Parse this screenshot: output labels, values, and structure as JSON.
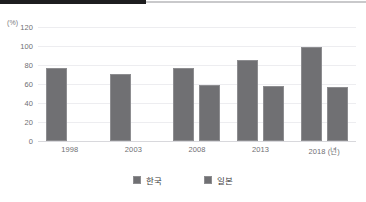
{
  "decor": {
    "top_dark_band": "#1d1d1f",
    "top_light_band": "#c9c9cb"
  },
  "colors": {
    "bar": "#707073",
    "bar_border": "#8d8d90",
    "gridline": "#ededf0",
    "baseline": "#d8d8dc",
    "tick_text": "#6f6f73",
    "legend_text": "#3c3c40"
  },
  "chart_data": {
    "type": "bar",
    "title": "",
    "subtitle": "",
    "xlabel": "(년)",
    "ylabel": "(%)",
    "unit_label": "(%)",
    "categories": [
      "1998",
      "2003",
      "2008",
      "2013",
      "2018 (년)"
    ],
    "series": [
      {
        "name": "한국",
        "color": "#707073",
        "values": [
          77,
          71,
          77,
          85,
          99
        ]
      },
      {
        "name": "일본",
        "color": "#707073",
        "values": [
          null,
          null,
          59,
          58,
          57
        ]
      }
    ],
    "ylim": [
      0,
      120
    ],
    "yticks": [
      120,
      100,
      80,
      60,
      40,
      20,
      0
    ],
    "ytick_labels": [
      "120",
      "100",
      "80",
      "60",
      "40",
      "20",
      "0"
    ],
    "grid": true,
    "grid_axis": "y",
    "legend": true,
    "legend_position": "bottom"
  },
  "legend": {
    "items": [
      {
        "label": "한국",
        "color": "#707073"
      },
      {
        "label": "일본",
        "color": "#707073"
      }
    ]
  }
}
